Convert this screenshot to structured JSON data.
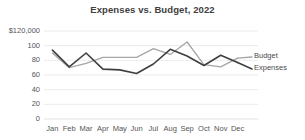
{
  "chart_data": {
    "type": "line",
    "title": "Expenses vs. Budget, 2022",
    "xlabel": "",
    "ylabel": "",
    "categories": [
      "Jan",
      "Feb",
      "Mar",
      "Apr",
      "May",
      "Jun",
      "Jul",
      "Aug",
      "Sep",
      "Oct",
      "Nov",
      "Dec"
    ],
    "series": [
      {
        "name": "Budget",
        "color": "#a6a6a6",
        "values": [
          90,
          70,
          76,
          84,
          84,
          84,
          96,
          88,
          105,
          74,
          71,
          83
        ]
      },
      {
        "name": "Expenses",
        "color": "#404040",
        "values": [
          94,
          71,
          90,
          68,
          67,
          62,
          75,
          95,
          86,
          73,
          87,
          77
        ]
      }
    ],
    "ylim": [
      0,
      120
    ],
    "yticks": [
      0,
      20,
      40,
      60,
      80,
      100,
      120
    ],
    "ytick_labels": [
      "0",
      "20",
      "40",
      "60",
      "80",
      "100",
      "$120,000"
    ],
    "grid": true,
    "grid_color": "#e6e6e6",
    "legend_position": "right-inline",
    "axis_color": "#d9d9d9"
  }
}
